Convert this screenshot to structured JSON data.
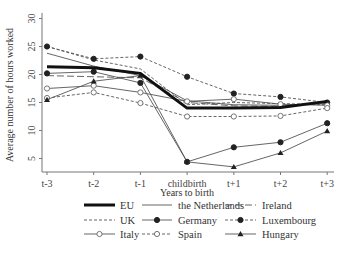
{
  "chart_data": {
    "type": "line",
    "title": "",
    "xlabel": "Years to birth",
    "ylabel": "Average number of hours worked",
    "categories": [
      "t-3",
      "t-2",
      "t-1",
      "childbirth",
      "t+1",
      "t+2",
      "t+3"
    ],
    "yticks": [
      5,
      10,
      15,
      20,
      25,
      30
    ],
    "ylim": [
      3,
      31
    ],
    "grid": false,
    "legend_position": "bottom",
    "series": [
      {
        "name": "EU",
        "style": "thick-solid",
        "marker": "none",
        "values": [
          21.4,
          21.2,
          20.2,
          14.0,
          14.0,
          14.1,
          15.2
        ]
      },
      {
        "name": "the Netherlands",
        "style": "solid",
        "marker": "none",
        "values": [
          23.8,
          21.5,
          19.8,
          15.3,
          14.6,
          14.5,
          14.8
        ]
      },
      {
        "name": "Ireland",
        "style": "long-dash",
        "marker": "none",
        "values": [
          19.8,
          19.6,
          19.4,
          15.0,
          14.4,
          14.3,
          15.0
        ]
      },
      {
        "name": "UK",
        "style": "dashed",
        "marker": "none",
        "values": [
          25.0,
          22.6,
          21.0,
          14.6,
          15.0,
          14.8,
          14.6
        ]
      },
      {
        "name": "Germany",
        "style": "solid",
        "marker": "filled-circle",
        "values": [
          20.2,
          20.5,
          18.5,
          4.4,
          7.0,
          7.9,
          11.3
        ]
      },
      {
        "name": "Luxembourg",
        "style": "dashed",
        "marker": "filled-circle",
        "values": [
          25.0,
          22.8,
          23.2,
          19.6,
          16.6,
          16.0,
          15.0
        ]
      },
      {
        "name": "Italy",
        "style": "solid",
        "marker": "open-circle",
        "values": [
          17.5,
          18.0,
          16.8,
          15.2,
          15.6,
          14.7,
          14.5
        ]
      },
      {
        "name": "Spain",
        "style": "dashed",
        "marker": "open-circle",
        "values": [
          15.8,
          16.8,
          14.9,
          12.5,
          12.5,
          12.6,
          14.0
        ]
      },
      {
        "name": "Hungary",
        "style": "solid",
        "marker": "filled-triangle",
        "values": [
          15.5,
          18.8,
          19.8,
          4.4,
          3.5,
          6.0,
          9.9
        ]
      }
    ]
  },
  "legend": {
    "rows": [
      [
        "EU",
        "the Netherlands",
        "Ireland"
      ],
      [
        "UK",
        "Germany",
        "Luxembourg"
      ],
      [
        "Italy",
        "Spain",
        "Hungary"
      ]
    ]
  }
}
